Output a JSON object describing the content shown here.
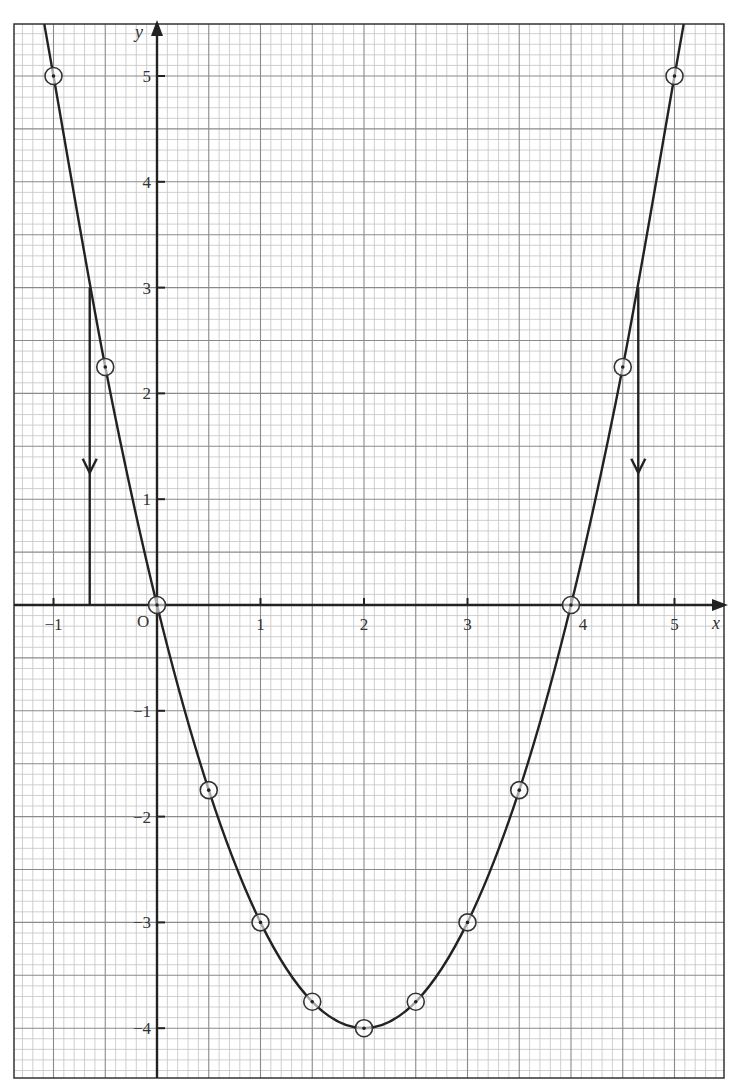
{
  "chart_data": {
    "type": "line",
    "title": "",
    "function": "y = x^2 - 4x",
    "xlabel": "x",
    "ylabel": "y",
    "origin_label": "O",
    "xlim": [
      -1.4,
      5.4
    ],
    "ylim": [
      -4.4,
      5.5
    ],
    "grid": true,
    "grid_minor_step": 0.1,
    "grid_major_step": 0.5,
    "x_ticks": [
      {
        "value": -1,
        "label": "−1"
      },
      {
        "value": 1,
        "label": "1"
      },
      {
        "value": 2,
        "label": "2"
      },
      {
        "value": 3,
        "label": "3"
      },
      {
        "value": 4,
        "label": "4"
      },
      {
        "value": 5,
        "label": "5"
      }
    ],
    "y_ticks": [
      {
        "value": 5,
        "label": "5"
      },
      {
        "value": 4,
        "label": "4"
      },
      {
        "value": 3,
        "label": "3"
      },
      {
        "value": 2,
        "label": "2"
      },
      {
        "value": 1,
        "label": "1"
      },
      {
        "value": -1,
        "label": "−1"
      },
      {
        "value": -2,
        "label": "−2"
      },
      {
        "value": -3,
        "label": "−3"
      },
      {
        "value": -4,
        "label": "−4"
      }
    ],
    "series": [
      {
        "name": "y = x^2 - 4x",
        "x": [
          -1,
          -0.5,
          0,
          0.5,
          1,
          1.5,
          2,
          2.5,
          3,
          3.5,
          4,
          4.5,
          5
        ],
        "y": [
          5,
          2.25,
          0,
          -1.75,
          -3,
          -3.75,
          -4,
          -3.75,
          -3,
          -1.75,
          0,
          2.25,
          5
        ],
        "marker": "circled-dot",
        "color": "#222222"
      }
    ],
    "annotations": [
      {
        "type": "vertical-arrow",
        "x": -0.65,
        "from_y": 3,
        "to_y": 0,
        "arrow_at_y": 1.25,
        "direction": "down"
      },
      {
        "type": "vertical-arrow",
        "x": 4.65,
        "from_y": 3,
        "to_y": 0,
        "arrow_at_y": 1.25,
        "direction": "down"
      }
    ]
  },
  "colors": {
    "ink": "#222222",
    "grid_major": "#8a8a8a",
    "grid_minor": "#c4c4c4",
    "paper": "#ffffff"
  }
}
